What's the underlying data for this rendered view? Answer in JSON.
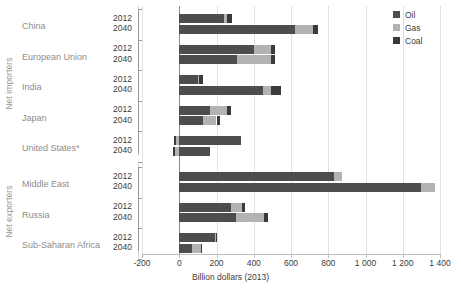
{
  "chart_data": {
    "type": "bar",
    "orientation": "horizontal",
    "stacked": true,
    "title": "",
    "xlabel": "Billion dollars (2013)",
    "ylabel": "",
    "xlim": [
      -200,
      1400
    ],
    "xticks": [
      -200,
      0,
      200,
      400,
      600,
      800,
      1000,
      1200,
      1400
    ],
    "xtick_labels": [
      "-200",
      "0",
      "200",
      "400",
      "600",
      "800",
      "1 000",
      "1 200",
      "1 400"
    ],
    "grid": true,
    "legend_position": "top-right",
    "series": [
      {
        "name": "Oil",
        "color": "#4d4d4d"
      },
      {
        "name": "Gas",
        "color": "#b3b3b3"
      },
      {
        "name": "Coal",
        "color": "#3a3a3a"
      }
    ],
    "groups": [
      {
        "group_label": "Net importers",
        "regions": [
          {
            "label": "China",
            "rows": [
              {
                "year": "2012",
                "Oil": 240,
                "Gas": 15,
                "Coal": 30
              },
              {
                "year": "2040",
                "Oil": 620,
                "Gas": 100,
                "Coal": 25
              }
            ]
          },
          {
            "label": "European Union",
            "rows": [
              {
                "year": "2012",
                "Oil": 400,
                "Gas": 95,
                "Coal": 20
              },
              {
                "year": "2040",
                "Oil": 310,
                "Gas": 185,
                "Coal": 18
              }
            ]
          },
          {
            "label": "India",
            "rows": [
              {
                "year": "2012",
                "Oil": 100,
                "Gas": 8,
                "Coal": 18
              },
              {
                "year": "2040",
                "Oil": 450,
                "Gas": 40,
                "Coal": 55
              }
            ]
          },
          {
            "label": "Japan",
            "rows": [
              {
                "year": "2012",
                "Oil": 165,
                "Gas": 90,
                "Coal": 25
              },
              {
                "year": "2040",
                "Oil": 130,
                "Gas": 70,
                "Coal": 20
              }
            ]
          },
          {
            "label": "United States*",
            "rows": [
              {
                "year": "2012",
                "Oil": 330,
                "Gas": -18,
                "Coal": -10
              },
              {
                "year": "2040",
                "Oil": 165,
                "Gas": -22,
                "Coal": -12
              }
            ]
          }
        ]
      },
      {
        "group_label": "Net exporters",
        "regions": [
          {
            "label": "Middle East",
            "rows": [
              {
                "year": "2012",
                "Oil": 830,
                "Gas": 45,
                "Coal": 0
              },
              {
                "year": "2040",
                "Oil": 1300,
                "Gas": 75,
                "Coal": 0
              }
            ]
          },
          {
            "label": "Russia",
            "rows": [
              {
                "year": "2012",
                "Oil": 280,
                "Gas": 55,
                "Coal": 18
              },
              {
                "year": "2040",
                "Oil": 305,
                "Gas": 150,
                "Coal": 20
              }
            ]
          },
          {
            "label": "Sub-Saharan Africa",
            "rows": [
              {
                "year": "2012",
                "Oil": 190,
                "Gas": 8,
                "Coal": 2
              },
              {
                "year": "2040",
                "Oil": 70,
                "Gas": 45,
                "Coal": 5
              }
            ]
          }
        ]
      }
    ]
  },
  "legend": {
    "items": [
      {
        "label": "Oil",
        "color": "#4d4d4d"
      },
      {
        "label": "Gas",
        "color": "#b3b3b3"
      },
      {
        "label": "Coal",
        "color": "#3a3a3a"
      }
    ]
  },
  "axis": {
    "xtitle": "Billion dollars (2013)"
  }
}
